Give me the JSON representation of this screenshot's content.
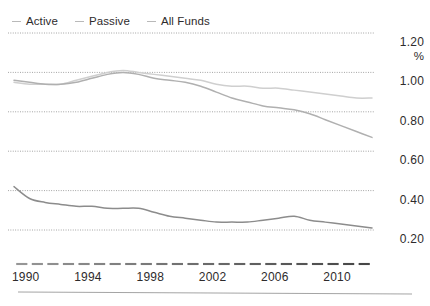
{
  "chart_data": {
    "type": "line",
    "title": "",
    "xlabel": "",
    "ylabel": "%",
    "unit_label": "%",
    "xlim": [
      1990,
      2013
    ],
    "ylim": [
      0.1,
      1.28
    ],
    "yticks": [
      "1.20",
      "1.00",
      "0.80",
      "0.60",
      "0.40",
      "0.20"
    ],
    "ytick_values": [
      1.2,
      1.0,
      0.8,
      0.6,
      0.4,
      0.2
    ],
    "xticks": [
      "1990",
      "1994",
      "1998",
      "2002",
      "2006",
      "2010"
    ],
    "xtick_values": [
      1990,
      1994,
      1998,
      2002,
      2006,
      2010
    ],
    "grid": true,
    "grid_style": "dotted",
    "legend_position": "top-left",
    "x": [
      1990,
      1991,
      1992,
      1993,
      1994,
      1995,
      1996,
      1997,
      1998,
      1999,
      2000,
      2001,
      2002,
      2003,
      2004,
      2005,
      2006,
      2007,
      2008,
      2009,
      2010,
      2011,
      2012,
      2013
    ],
    "series": [
      {
        "name": "Active",
        "color": "#b0b0b0",
        "values": [
          0.96,
          0.95,
          0.94,
          0.94,
          0.95,
          0.97,
          0.99,
          1.0,
          0.99,
          0.97,
          0.96,
          0.95,
          0.93,
          0.9,
          0.87,
          0.85,
          0.83,
          0.82,
          0.81,
          0.79,
          0.76,
          0.73,
          0.7,
          0.67
        ]
      },
      {
        "name": "Passive",
        "color": "#8c8c8c",
        "values": [
          0.42,
          0.36,
          0.34,
          0.33,
          0.32,
          0.32,
          0.31,
          0.31,
          0.31,
          0.29,
          0.27,
          0.26,
          0.25,
          0.24,
          0.24,
          0.24,
          0.25,
          0.26,
          0.27,
          0.25,
          0.24,
          0.23,
          0.22,
          0.21
        ]
      },
      {
        "name": "All Funds",
        "color": "#cfcfcf",
        "values": [
          0.95,
          0.94,
          0.94,
          0.94,
          0.96,
          0.98,
          1.0,
          1.01,
          1.0,
          0.99,
          0.98,
          0.97,
          0.96,
          0.94,
          0.93,
          0.93,
          0.92,
          0.92,
          0.91,
          0.9,
          0.89,
          0.88,
          0.87,
          0.87
        ]
      }
    ]
  },
  "legend": {
    "items": [
      {
        "label": "Active"
      },
      {
        "label": "Passive"
      },
      {
        "label": "All Funds"
      }
    ]
  }
}
